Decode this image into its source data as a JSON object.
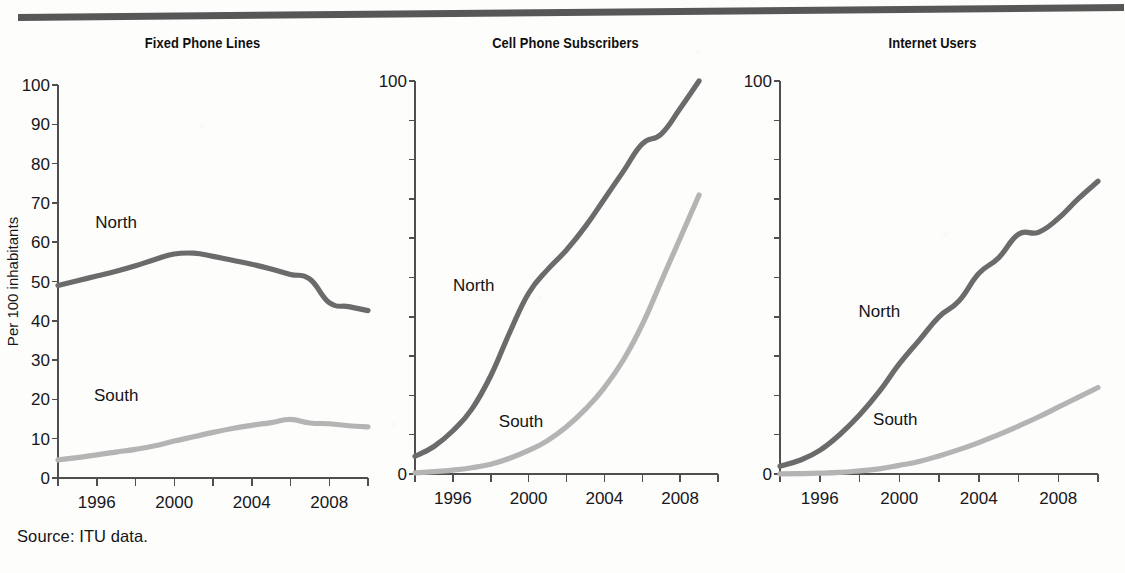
{
  "figure": {
    "source_note": "Source: ITU data.",
    "y_axis_title": "Per 100 inhabitants",
    "series_colors": {
      "north": "#6b6b6b",
      "south": "#b4b4b4"
    },
    "rule_color": "#5a5a5a"
  },
  "chart_data": [
    {
      "type": "line",
      "title": "Fixed Phone Lines",
      "xlabel": "",
      "ylabel": "Per 100 inhabitants",
      "xlim": [
        1994,
        2010
      ],
      "ylim": [
        0,
        100
      ],
      "grid": false,
      "legend_position": "inline",
      "y_ticks": [
        0,
        10,
        20,
        30,
        40,
        50,
        60,
        70,
        80,
        90,
        100
      ],
      "y_tick_labels": [
        "0",
        "10",
        "20",
        "30",
        "40",
        "50",
        "60",
        "70",
        "80",
        "90",
        "100"
      ],
      "x_ticks": [
        1994,
        1996,
        1998,
        2000,
        2002,
        2004,
        2006,
        2008,
        2010
      ],
      "x_tick_labels": [
        "",
        "1996",
        "",
        "2000",
        "",
        "2004",
        "",
        "2008",
        ""
      ],
      "x": [
        1994,
        1995,
        1996,
        1997,
        1998,
        1999,
        2000,
        2001,
        2002,
        2003,
        2004,
        2005,
        2006,
        2007,
        2008,
        2009,
        2010
      ],
      "series": [
        {
          "name": "North",
          "color": "#6b6b6b",
          "values": [
            49.0,
            50.2,
            51.4,
            52.6,
            54.0,
            55.6,
            57.0,
            57.2,
            56.4,
            55.4,
            54.4,
            53.2,
            51.8,
            50.6,
            44.6,
            43.6,
            42.6
          ]
        },
        {
          "name": "South",
          "color": "#b4b4b4",
          "values": [
            4.6,
            5.2,
            5.9,
            6.6,
            7.3,
            8.2,
            9.4,
            10.5,
            11.6,
            12.6,
            13.4,
            14.1,
            14.9,
            14.0,
            13.8,
            13.3,
            13.0
          ]
        }
      ],
      "annotations": [
        {
          "text": "North",
          "x": 1997.0,
          "y": 63.5
        },
        {
          "text": "South",
          "x": 1997.0,
          "y": 19.5
        }
      ]
    },
    {
      "type": "line",
      "title": "Cell Phone Subscribers",
      "xlabel": "",
      "ylabel": "",
      "xlim": [
        1994,
        2010
      ],
      "ylim": [
        0,
        100
      ],
      "grid": false,
      "legend_position": "inline",
      "y_ticks": [
        0,
        10,
        20,
        30,
        40,
        50,
        60,
        70,
        80,
        90,
        100
      ],
      "y_tick_labels": [
        "0",
        "",
        "",
        "",
        "",
        "",
        "",
        "",
        "",
        "",
        "100"
      ],
      "x_ticks": [
        1994,
        1996,
        1998,
        2000,
        2002,
        2004,
        2006,
        2008,
        2010
      ],
      "x_tick_labels": [
        "",
        "1996",
        "",
        "2000",
        "",
        "2004",
        "",
        "2008",
        ""
      ],
      "x": [
        1994,
        1995,
        1996,
        1997,
        1998,
        1999,
        2000,
        2001,
        2002,
        2003,
        2004,
        2005,
        2006,
        2007,
        2008,
        2009
      ],
      "series": [
        {
          "name": "North",
          "color": "#6b6b6b",
          "values": [
            4.5,
            7.0,
            11.0,
            16.5,
            25.0,
            36.0,
            46.0,
            52.0,
            57.0,
            63.0,
            70.0,
            77.0,
            84.0,
            86.5,
            93.0,
            100.0
          ]
        },
        {
          "name": "South",
          "color": "#b4b4b4",
          "values": [
            0.3,
            0.6,
            1.0,
            1.6,
            2.5,
            4.0,
            6.0,
            8.5,
            12.0,
            16.5,
            22.0,
            29.0,
            38.0,
            49.0,
            60.0,
            71.0
          ]
        }
      ],
      "annotations": [
        {
          "text": "North",
          "x": 1997.1,
          "y": 46.5
        },
        {
          "text": "South",
          "x": 1999.6,
          "y": 12.0
        }
      ]
    },
    {
      "type": "line",
      "title": "Internet Users",
      "xlabel": "",
      "ylabel": "",
      "xlim": [
        1994,
        2010
      ],
      "ylim": [
        0,
        100
      ],
      "grid": false,
      "legend_position": "inline",
      "y_ticks": [
        0,
        10,
        20,
        30,
        40,
        50,
        60,
        70,
        80,
        90,
        100
      ],
      "y_tick_labels": [
        "0",
        "",
        "",
        "",
        "",
        "",
        "",
        "",
        "",
        "",
        "100"
      ],
      "x_ticks": [
        1994,
        1996,
        1998,
        2000,
        2002,
        2004,
        2006,
        2008,
        2010
      ],
      "x_tick_labels": [
        "",
        "1996",
        "",
        "2000",
        "",
        "2004",
        "",
        "2008",
        ""
      ],
      "x": [
        1994,
        1995,
        1996,
        1997,
        1998,
        1999,
        2000,
        2001,
        2002,
        2003,
        2004,
        2005,
        2006,
        2007,
        2008,
        2009,
        2010
      ],
      "series": [
        {
          "name": "North",
          "color": "#6b6b6b",
          "values": [
            2.0,
            3.5,
            6.0,
            10.0,
            15.0,
            21.0,
            28.0,
            34.0,
            40.0,
            44.0,
            51.0,
            55.0,
            61.0,
            61.5,
            65.0,
            70.0,
            74.5
          ]
        },
        {
          "name": "South",
          "color": "#b4b4b4",
          "values": [
            0.05,
            0.1,
            0.2,
            0.4,
            0.8,
            1.3,
            2.2,
            3.2,
            4.6,
            6.2,
            8.0,
            10.0,
            12.2,
            14.5,
            17.0,
            19.5,
            22.0
          ]
        }
      ],
      "annotations": [
        {
          "text": "North",
          "x": 1999.0,
          "y": 40.0
        },
        {
          "text": "South",
          "x": 1999.8,
          "y": 12.5
        }
      ]
    }
  ]
}
